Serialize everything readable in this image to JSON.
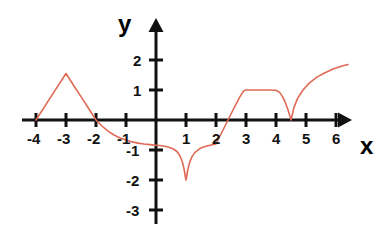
{
  "figure": {
    "background_color": "#ffffff",
    "axis_color": "#111111",
    "curve_color": "#e06a56",
    "x_axis_label": "x",
    "y_axis_label": "y",
    "x_tick_labels": [
      "-4",
      "-3",
      "-2",
      "-1",
      "1",
      "2",
      "3",
      "4",
      "5",
      "6"
    ],
    "y_tick_labels": [
      "2",
      "1",
      "-1",
      "-2",
      "-3"
    ]
  },
  "chart_data": {
    "type": "line",
    "title": "",
    "xlabel": "x",
    "ylabel": "y",
    "xlim": [
      -4.6,
      6.6
    ],
    "ylim": [
      -3.4,
      2.4
    ],
    "xticks": [
      -4,
      -3,
      -2,
      -1,
      1,
      2,
      3,
      4,
      5,
      6
    ],
    "yticks": [
      2,
      1,
      -1,
      -2,
      -3
    ],
    "grid": false,
    "legend": false,
    "series": [
      {
        "name": "f(x)",
        "points": [
          [
            -4.0,
            0.0
          ],
          [
            -3.5,
            0.78
          ],
          [
            -3.0,
            1.55
          ],
          [
            -2.75,
            1.16
          ],
          [
            -2.5,
            0.78
          ],
          [
            -2.25,
            0.39
          ],
          [
            -2.0,
            0.0
          ],
          [
            -1.8,
            -0.2
          ],
          [
            -1.6,
            -0.37
          ],
          [
            -1.4,
            -0.5
          ],
          [
            -1.2,
            -0.6
          ],
          [
            -1.0,
            -0.67
          ],
          [
            -0.8,
            -0.73
          ],
          [
            -0.6,
            -0.77
          ],
          [
            -0.4,
            -0.8
          ],
          [
            -0.2,
            -0.82
          ],
          [
            0.0,
            -0.84
          ],
          [
            0.2,
            -0.86
          ],
          [
            0.4,
            -0.9
          ],
          [
            0.55,
            -0.95
          ],
          [
            0.7,
            -1.05
          ],
          [
            0.8,
            -1.2
          ],
          [
            0.88,
            -1.4
          ],
          [
            0.94,
            -1.65
          ],
          [
            0.98,
            -1.9
          ],
          [
            1.0,
            -2.0
          ],
          [
            1.02,
            -1.9
          ],
          [
            1.06,
            -1.65
          ],
          [
            1.12,
            -1.42
          ],
          [
            1.2,
            -1.22
          ],
          [
            1.3,
            -1.08
          ],
          [
            1.45,
            -0.96
          ],
          [
            1.6,
            -0.89
          ],
          [
            1.8,
            -0.84
          ],
          [
            2.0,
            -0.8
          ],
          [
            2.2,
            -0.4
          ],
          [
            2.4,
            0.0
          ],
          [
            2.6,
            0.4
          ],
          [
            2.8,
            0.78
          ],
          [
            2.92,
            0.97
          ],
          [
            3.0,
            1.0
          ],
          [
            3.4,
            1.0
          ],
          [
            3.8,
            1.0
          ],
          [
            4.0,
            0.99
          ],
          [
            4.12,
            0.92
          ],
          [
            4.22,
            0.78
          ],
          [
            4.32,
            0.56
          ],
          [
            4.42,
            0.28
          ],
          [
            4.5,
            0.0
          ],
          [
            4.6,
            0.42
          ],
          [
            4.72,
            0.72
          ],
          [
            4.9,
            1.0
          ],
          [
            5.1,
            1.22
          ],
          [
            5.35,
            1.42
          ],
          [
            5.6,
            1.56
          ],
          [
            5.9,
            1.7
          ],
          [
            6.2,
            1.8
          ],
          [
            6.4,
            1.85
          ]
        ]
      }
    ],
    "annotations": [
      "zero crossings at x = -4, -2, 2.4, 4.5",
      "local maximum at (-3, 1.55)",
      "downward cusp minimum at (1, -2)",
      "plateau at y = 1 between x = 3 and x = 4",
      "corner at (2, -0.8)"
    ]
  },
  "geometry": {
    "origin_x": 156,
    "origin_y": 120,
    "unit_px": 30
  }
}
